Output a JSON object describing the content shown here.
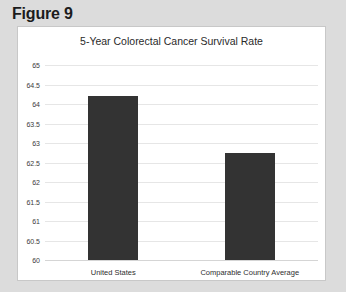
{
  "figure": {
    "label": "Figure 9"
  },
  "chart_data": {
    "type": "bar",
    "title": "5-Year Colorectal Cancer Survival Rate",
    "xlabel": "",
    "ylabel": "",
    "categories": [
      "United States",
      "Comparable Country Average"
    ],
    "values": [
      64.2,
      62.75
    ],
    "ylim": [
      60,
      65
    ],
    "ytick_labels": [
      "65",
      "64.5",
      "64",
      "63.5",
      "63",
      "62.5",
      "62",
      "61.5",
      "61",
      "60.5",
      "60"
    ],
    "ytick_values": [
      65,
      64.5,
      64,
      63.5,
      63,
      62.5,
      62,
      61.5,
      61,
      60.5,
      60
    ],
    "grid": true,
    "legend": false,
    "series": [
      {
        "name": "5-Year Colorectal Cancer Survival Rate",
        "values": [
          64.2,
          62.75
        ],
        "color": "#333333"
      }
    ]
  },
  "colors": {
    "bar": "#333333",
    "panel": "#ffffff",
    "page": "#dcdcdc",
    "gridline": "#e6e6e6"
  }
}
